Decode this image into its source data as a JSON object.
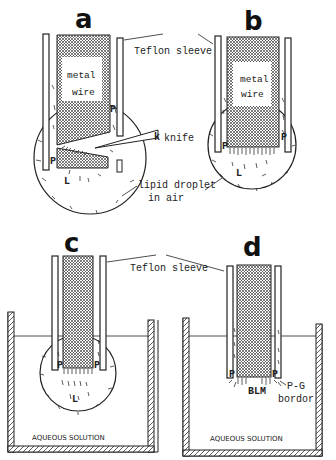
{
  "figure": {
    "panels": [
      {
        "id": "a",
        "label": "a",
        "wire_label_line1": "metal",
        "wire_label_line2": "wire",
        "marks": [
          "P",
          "P",
          "L"
        ]
      },
      {
        "id": "b",
        "label": "b",
        "wire_label_line1": "metal",
        "wire_label_line2": "wire",
        "marks": [
          "P",
          "P",
          "L"
        ]
      },
      {
        "id": "c",
        "label": "c",
        "marks": [
          "P",
          "P",
          "L"
        ]
      },
      {
        "id": "d",
        "label": "d",
        "marks": [
          "P",
          "P",
          "BLM"
        ]
      }
    ],
    "annotations": {
      "teflon_top": "Teflon sleeve",
      "knife": "knife",
      "knife_mark": "k",
      "droplet_line1": "lipid droplet",
      "droplet_line2": "in air",
      "teflon_bottom": "Teflon sleeve",
      "pg_line1": "P-G",
      "pg_line2": "bordor",
      "aqueous_c": "AQUEOUS SOLUTION",
      "aqueous_d": "AQUEOUS SOLUTION"
    },
    "colors": {
      "ink": "#222222",
      "background": "#ffffff",
      "hatch": "#555555"
    }
  }
}
